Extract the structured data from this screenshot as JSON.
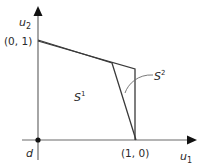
{
  "diagram": {
    "axes": {
      "x_label": "u",
      "x_sub": "1",
      "y_label": "u",
      "y_sub": "2"
    },
    "points": {
      "origin": "d",
      "y_intercept": "(0, 1)",
      "x_intercept": "(1, 0)"
    },
    "regions": {
      "s1_base": "S",
      "s1_sup": "1",
      "s2_base": "S",
      "s2_sup": "2"
    },
    "colors": {
      "axis": "#5a5a5a",
      "line": "#3a3a3a",
      "text": "#2a2a2a"
    }
  }
}
